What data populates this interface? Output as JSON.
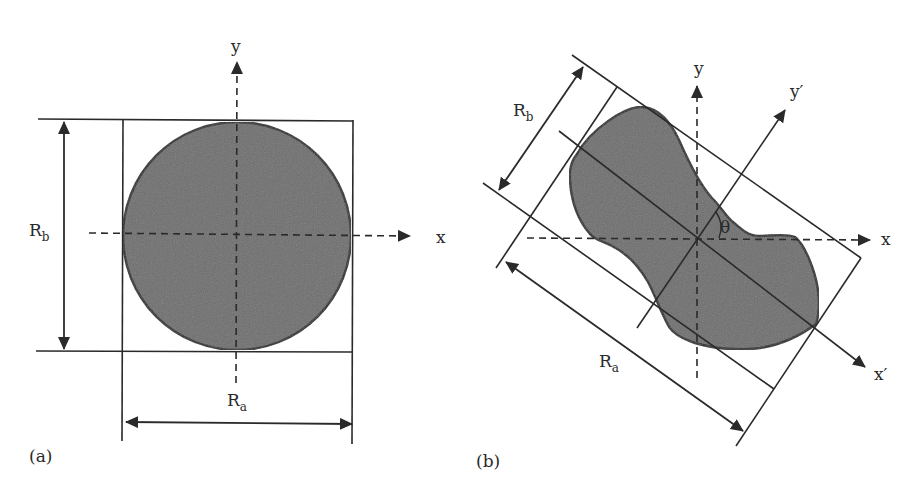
{
  "figure": {
    "colors": {
      "shape_fill": "#6e6e6e",
      "stroke": "#2a2a2a",
      "background": "#ffffff"
    },
    "panel_a": {
      "label": "(a)",
      "axis_x": "x",
      "axis_y": "y",
      "dim_a": {
        "main": "R",
        "sub": "a"
      },
      "dim_b": {
        "main": "R",
        "sub": "b"
      },
      "shape": "circle"
    },
    "panel_b": {
      "label": "(b)",
      "axis_x": "x",
      "axis_y": "y",
      "axis_x_prime": "x′",
      "axis_y_prime": "y′",
      "angle": "θ",
      "dim_a": {
        "main": "R",
        "sub": "a"
      },
      "dim_b": {
        "main": "R",
        "sub": "b"
      },
      "shape": "irregular-particle"
    }
  }
}
